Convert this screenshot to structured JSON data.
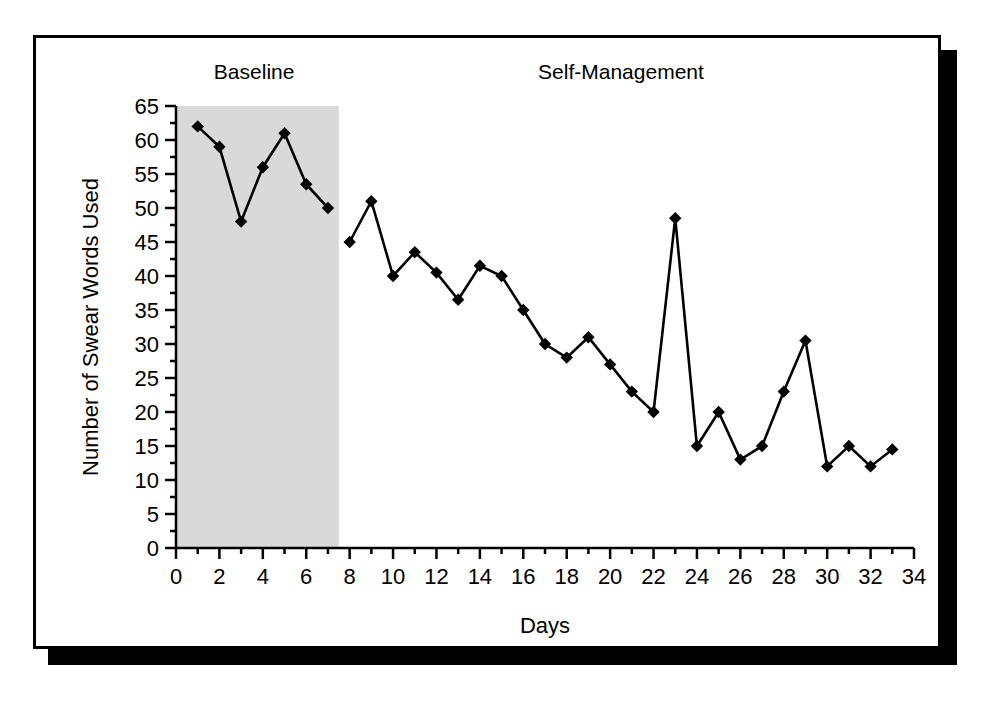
{
  "figure": {
    "phase_labels": {
      "baseline": "Baseline",
      "intervention": "Self-Management"
    },
    "xlabel": "Days",
    "ylabel": "Number of Swear Words Used",
    "shading_color": "#d9d9d9",
    "line_color": "#000000",
    "marker_color": "#000000",
    "background_color": "#ffffff",
    "frame_color": "#000000"
  },
  "chart_data": {
    "type": "line",
    "title": "",
    "subtitle": "",
    "xlabel": "Days",
    "ylabel": "Number of Swear Words Used",
    "xlim": [
      0,
      34
    ],
    "ylim": [
      0,
      65
    ],
    "xticks": [
      0,
      2,
      4,
      6,
      8,
      10,
      12,
      14,
      16,
      18,
      20,
      22,
      24,
      26,
      28,
      30,
      32,
      34
    ],
    "xtick_labels": [
      "0",
      "2",
      "4",
      "6",
      "8",
      "10",
      "12",
      "14",
      "16",
      "18",
      "20",
      "22",
      "24",
      "26",
      "28",
      "30",
      "32",
      "34"
    ],
    "x_minor_tick_step": 1,
    "yticks": [
      0,
      5,
      10,
      15,
      20,
      25,
      30,
      35,
      40,
      45,
      50,
      55,
      60,
      65
    ],
    "ytick_labels": [
      "0",
      "5",
      "10",
      "15",
      "20",
      "25",
      "30",
      "35",
      "40",
      "45",
      "50",
      "55",
      "60",
      "65"
    ],
    "y_minor_tick_step": 2.5,
    "grid": false,
    "legend": false,
    "marker": "diamond",
    "phases": [
      {
        "name": "Baseline",
        "x_start": 0,
        "x_end": 7.5,
        "shaded": true
      },
      {
        "name": "Self-Management",
        "x_start": 7.5,
        "x_end": 34,
        "shaded": false
      }
    ],
    "annotations": [
      {
        "text": "Baseline",
        "x": 3.6,
        "y": 69
      },
      {
        "text": "Self-Management",
        "x": 20.5,
        "y": 69
      }
    ],
    "series": [
      {
        "name": "Swear words per day",
        "x": [
          1,
          2,
          3,
          4,
          5,
          6,
          7,
          8,
          9,
          10,
          11,
          12,
          13,
          14,
          15,
          16,
          17,
          18,
          19,
          20,
          21,
          22,
          23,
          24,
          25,
          26,
          27,
          28,
          29,
          30,
          31,
          32,
          33
        ],
        "values": [
          62,
          59,
          48,
          56,
          61,
          53.5,
          50,
          45,
          51,
          40,
          43.5,
          40.5,
          36.5,
          41.5,
          40,
          35,
          30,
          28,
          31,
          27,
          23,
          20,
          48.5,
          15,
          20,
          13,
          15,
          23,
          30.5,
          12,
          15,
          12,
          14.5
        ]
      }
    ]
  }
}
